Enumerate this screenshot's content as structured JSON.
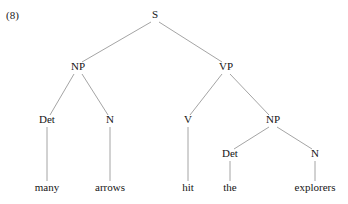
{
  "figure": {
    "example_number": "(8)",
    "sentence": "many arrows hit the explorers",
    "line_color": "#9a9a9a",
    "text_color": "#151515",
    "background_color": "#ffffff"
  },
  "chart_data": {
    "type": "diagram",
    "diagram_type": "syntax-tree",
    "title": "(8)",
    "sentence": "many arrows hit the explorers",
    "nodes": [
      {
        "id": "S",
        "label": "S",
        "x": 155,
        "y": 18,
        "kind": "nonterminal"
      },
      {
        "id": "NP1",
        "label": "NP",
        "x": 78,
        "y": 70,
        "kind": "nonterminal"
      },
      {
        "id": "VP",
        "label": "VP",
        "x": 226,
        "y": 70,
        "kind": "nonterminal"
      },
      {
        "id": "Det1",
        "label": "Det",
        "x": 47,
        "y": 123,
        "kind": "preterminal"
      },
      {
        "id": "N1",
        "label": "N",
        "x": 110,
        "y": 123,
        "kind": "preterminal"
      },
      {
        "id": "V",
        "label": "V",
        "x": 188,
        "y": 123,
        "kind": "preterminal"
      },
      {
        "id": "NP2",
        "label": "NP",
        "x": 273,
        "y": 123,
        "kind": "nonterminal"
      },
      {
        "id": "Det2",
        "label": "Det",
        "x": 230,
        "y": 157,
        "kind": "preterminal"
      },
      {
        "id": "N2",
        "label": "N",
        "x": 315,
        "y": 157,
        "kind": "preterminal"
      },
      {
        "id": "W1",
        "label": "many",
        "x": 47,
        "y": 191,
        "kind": "terminal"
      },
      {
        "id": "W2",
        "label": "arrows",
        "x": 110,
        "y": 191,
        "kind": "terminal"
      },
      {
        "id": "W3",
        "label": "hit",
        "x": 188,
        "y": 191,
        "kind": "terminal"
      },
      {
        "id": "W4",
        "label": "the",
        "x": 230,
        "y": 191,
        "kind": "terminal"
      },
      {
        "id": "W5",
        "label": "explorers",
        "x": 315,
        "y": 191,
        "kind": "terminal"
      }
    ],
    "edges": [
      {
        "from": "S",
        "to": "NP1",
        "x1": 151,
        "y1": 22,
        "x2": 82,
        "y2": 62
      },
      {
        "from": "S",
        "to": "VP",
        "x1": 159,
        "y1": 22,
        "x2": 222,
        "y2": 62
      },
      {
        "from": "NP1",
        "to": "Det1",
        "x1": 74,
        "y1": 74,
        "x2": 50,
        "y2": 115
      },
      {
        "from": "NP1",
        "to": "N1",
        "x1": 82,
        "y1": 74,
        "x2": 108,
        "y2": 115
      },
      {
        "from": "VP",
        "to": "V",
        "x1": 222,
        "y1": 74,
        "x2": 190,
        "y2": 115
      },
      {
        "from": "VP",
        "to": "NP2",
        "x1": 230,
        "y1": 74,
        "x2": 269,
        "y2": 115
      },
      {
        "from": "Det1",
        "to": "W1",
        "x1": 47,
        "y1": 127,
        "x2": 47,
        "y2": 181
      },
      {
        "from": "N1",
        "to": "W2",
        "x1": 110,
        "y1": 127,
        "x2": 110,
        "y2": 181
      },
      {
        "from": "V",
        "to": "W3",
        "x1": 188,
        "y1": 127,
        "x2": 188,
        "y2": 181
      },
      {
        "from": "NP2",
        "to": "Det2",
        "x1": 269,
        "y1": 127,
        "x2": 234,
        "y2": 149
      },
      {
        "from": "NP2",
        "to": "N2",
        "x1": 277,
        "y1": 127,
        "x2": 312,
        "y2": 149
      },
      {
        "from": "Det2",
        "to": "W4",
        "x1": 230,
        "y1": 161,
        "x2": 230,
        "y2": 181
      },
      {
        "from": "N2",
        "to": "W5",
        "x1": 315,
        "y1": 161,
        "x2": 315,
        "y2": 181
      }
    ],
    "constituency": "[S [NP [Det many] [N arrows]] [VP [V hit] [NP [Det the] [N explorers]]]]"
  }
}
